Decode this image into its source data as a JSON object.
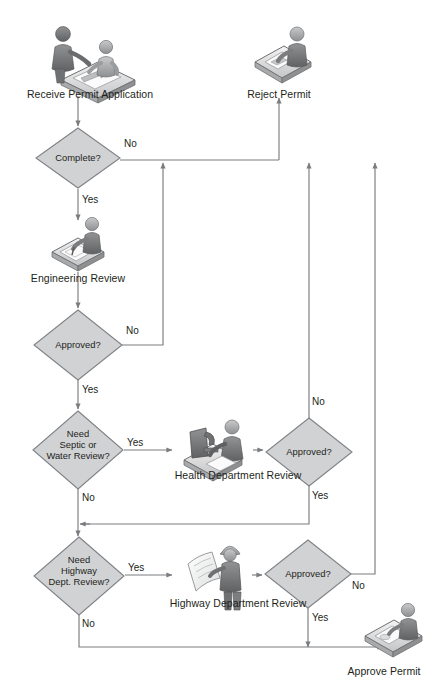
{
  "document": {
    "title": "Building Permit Approval Process Flowchart",
    "type": "flowchart",
    "background_color": "#ffffff",
    "line_color": "#808285",
    "shape_fill": "#d1d2d4",
    "shape_stroke": "#808285",
    "text_color": "#231f20"
  },
  "nodes": {
    "receive_permit": {
      "label": "Receive Permit Application",
      "shape": "icon",
      "icon": "two-people-at-desk-with-document-icon",
      "x": 88,
      "y": 55
    },
    "reject_permit": {
      "label": "Reject Permit",
      "shape": "icon",
      "icon": "person-at-desk-stamping-icon",
      "x": 279,
      "y": 55
    },
    "complete_decision": {
      "label": "Complete?",
      "shape": "diamond",
      "cx": 78,
      "cy": 158,
      "rx": 42,
      "ry": 30
    },
    "engineering_review": {
      "label": "Engineering Review",
      "shape": "icon",
      "icon": "person-at-drafting-table-icon",
      "x": 78,
      "y": 240
    },
    "approved_engineering": {
      "label": "Approved?",
      "shape": "diamond",
      "cx": 78,
      "cy": 345,
      "rx": 44,
      "ry": 35
    },
    "need_septic": {
      "label": "Need\nSeptic or\nWater Review?",
      "lines": [
        "Need",
        "Septic or",
        "Water Review?"
      ],
      "shape": "diamond",
      "cx": 78,
      "cy": 450,
      "rx": 45,
      "ry": 39
    },
    "health_review": {
      "label": "Health Department Review",
      "shape": "icon",
      "icon": "person-with-microscope-icon",
      "x": 213,
      "y": 445
    },
    "approved_health": {
      "label": "Approved?",
      "shape": "diamond",
      "cx": 309,
      "cy": 452,
      "rx": 43,
      "ry": 34
    },
    "need_highway": {
      "label": "Need\nHighway\nDept. Review?",
      "lines": [
        "Need",
        "Highway",
        "Dept. Review?"
      ],
      "shape": "diamond",
      "cx": 79,
      "cy": 576,
      "rx": 45,
      "ry": 39
    },
    "highway_review": {
      "label": "Highway Department Review",
      "shape": "icon",
      "icon": "person-with-hardhat-blueprint-icon",
      "x": 213,
      "y": 570
    },
    "approved_highway": {
      "label": "Approved?",
      "shape": "diamond",
      "cx": 308,
      "cy": 574,
      "rx": 43,
      "ry": 34
    },
    "approve_permit": {
      "label": "Approve Permit",
      "shape": "icon",
      "icon": "person-at-desk-approving-icon",
      "x": 392,
      "y": 635
    }
  },
  "edge_labels": {
    "complete_no": "No",
    "complete_yes": "Yes",
    "approved_engineering_no": "No",
    "approved_engineering_yes": "Yes",
    "need_septic_yes": "Yes",
    "need_septic_no": "No",
    "approved_health_no": "No",
    "approved_health_yes": "Yes",
    "need_highway_yes": "Yes",
    "need_highway_no": "No",
    "approved_highway_no": "No",
    "approved_highway_yes": "Yes"
  },
  "flow_edges": [
    {
      "from": "receive_permit",
      "to": "complete_decision",
      "label": ""
    },
    {
      "from": "complete_decision",
      "to": "reject_permit",
      "label": "No"
    },
    {
      "from": "complete_decision",
      "to": "engineering_review",
      "label": "Yes"
    },
    {
      "from": "engineering_review",
      "to": "approved_engineering",
      "label": ""
    },
    {
      "from": "approved_engineering",
      "to": "reject_permit",
      "label": "No"
    },
    {
      "from": "approved_engineering",
      "to": "need_septic",
      "label": "Yes"
    },
    {
      "from": "need_septic",
      "to": "health_review",
      "label": "Yes"
    },
    {
      "from": "need_septic",
      "to": "need_highway",
      "label": "No"
    },
    {
      "from": "health_review",
      "to": "approved_health",
      "label": ""
    },
    {
      "from": "approved_health",
      "to": "reject_permit",
      "label": "No"
    },
    {
      "from": "approved_health",
      "to": "need_highway",
      "label": "Yes"
    },
    {
      "from": "need_highway",
      "to": "highway_review",
      "label": "Yes"
    },
    {
      "from": "need_highway",
      "to": "approve_permit",
      "label": "No"
    },
    {
      "from": "highway_review",
      "to": "approved_highway",
      "label": ""
    },
    {
      "from": "approved_highway",
      "to": "reject_permit",
      "label": "No"
    },
    {
      "from": "approved_highway",
      "to": "approve_permit",
      "label": "Yes"
    }
  ]
}
